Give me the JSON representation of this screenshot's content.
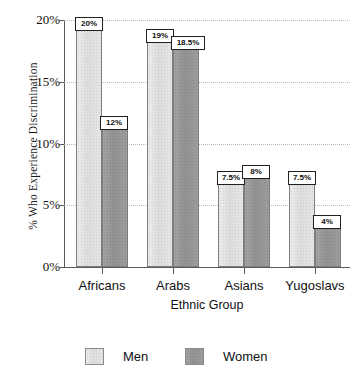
{
  "chart_data": {
    "type": "bar",
    "title": "",
    "xlabel": "Ethnic Group",
    "ylabel": "% Who Experience Discrimination",
    "categories": [
      "Africans",
      "Arabs",
      "Asians",
      "Yugoslavs"
    ],
    "series": [
      {
        "name": "Men",
        "color": "#e3e3e3",
        "values": [
          20,
          19,
          7.5,
          7.5
        ],
        "labels": [
          "20%",
          "19%",
          "7.5%",
          "7.5%"
        ]
      },
      {
        "name": "Women",
        "color": "#9a9a9a",
        "values": [
          12,
          18.5,
          8,
          4
        ],
        "labels": [
          "12%",
          "18.5%",
          "8%",
          "4%"
        ]
      }
    ],
    "ylim": [
      0,
      20
    ],
    "yticks": [
      0,
      5,
      10,
      15,
      20
    ],
    "ytick_labels": [
      "0%",
      "5%",
      "10%",
      "15%",
      "20%"
    ],
    "grid": true,
    "grid_style": "dotted",
    "legend_position": "bottom"
  },
  "legend": {
    "entries": [
      {
        "label": "Men"
      },
      {
        "label": "Women"
      }
    ]
  }
}
